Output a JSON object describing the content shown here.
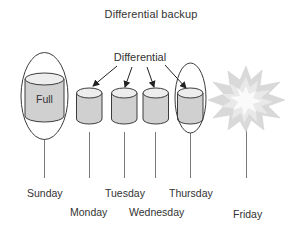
{
  "title": "Differential backup",
  "differential_label": "Differential",
  "full_label": "Full",
  "days": [
    {
      "name": "Sunday",
      "backup": "Full",
      "highlighted": true
    },
    {
      "name": "Monday",
      "backup": "Differential",
      "highlighted": false
    },
    {
      "name": "Tuesday",
      "backup": "Differential",
      "highlighted": false
    },
    {
      "name": "Wednesday",
      "backup": "Differential",
      "highlighted": false
    },
    {
      "name": "Thursday",
      "backup": "Differential",
      "highlighted": true
    },
    {
      "name": "Friday",
      "backup": "Failure",
      "highlighted": false
    }
  ],
  "icons": {
    "cylinder": "database-cylinder-icon",
    "failure": "explosion-starburst-icon",
    "arrow": "arrow-icon"
  },
  "colors": {
    "outline": "#3c3c3c",
    "cylinder_body": "#d0d0d0",
    "cylinder_top": "#ededed",
    "timeline": "#7a7a7a",
    "burst_outer": "#d9d9d9",
    "burst_mid": "#e9e9e9",
    "burst_inner": "#fafafa",
    "text": "#333333"
  }
}
